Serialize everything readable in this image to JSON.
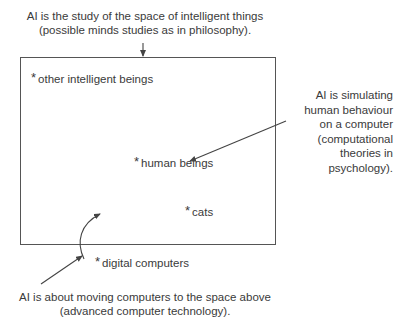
{
  "diagram": {
    "top_caption": {
      "line1": "AI is the study of the space of intelligent things",
      "line2": "(possible minds studies as in philosophy)."
    },
    "right_caption": {
      "lines": [
        "AI is simulating",
        "human behaviour",
        "on a computer",
        "(computational",
        "theories in",
        "psychology)."
      ]
    },
    "bottom_caption": {
      "line1": "AI is about moving computers to the space above",
      "line2": "(advanced computer technology)."
    },
    "items": [
      {
        "marker": "*",
        "label": "other intelligent beings"
      },
      {
        "marker": "*",
        "label": "human beings"
      },
      {
        "marker": "*",
        "label": "cats"
      },
      {
        "marker": "*",
        "label": "digital computers"
      }
    ],
    "colors": {
      "ink": "#3a3a3a",
      "line": "#555555"
    }
  }
}
